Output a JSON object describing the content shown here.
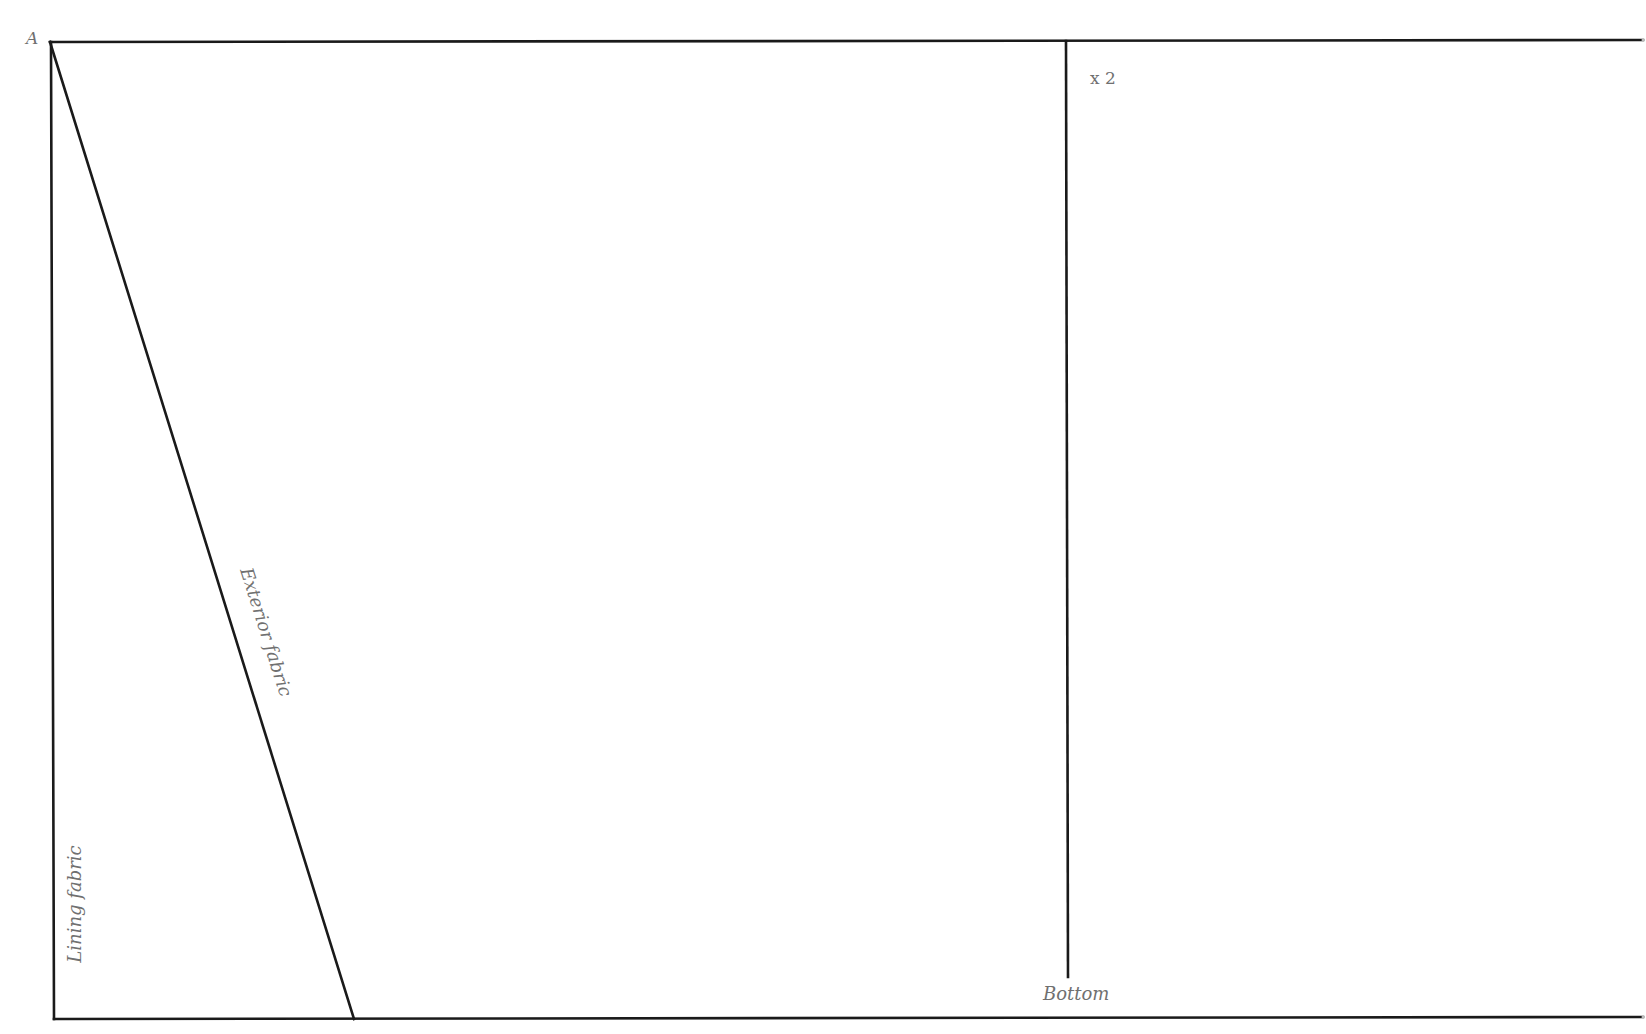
{
  "diagram": {
    "type": "sewing-pattern-piece",
    "stroke_color": "#1a1a1a",
    "label_color": "#707070",
    "background": "#ffffff",
    "points": {
      "A": [
        50,
        42
      ],
      "top_right": [
        1643,
        41
      ],
      "bottom_left": [
        54,
        1019
      ],
      "bottom_right": [
        1643,
        1018
      ],
      "diagonal_end": [
        354,
        1019
      ],
      "fold_top": [
        1066,
        41
      ],
      "fold_bottom": [
        1068,
        977
      ]
    },
    "lines": [
      {
        "name": "top-edge",
        "from": [
          50,
          42
        ],
        "to": [
          1643,
          40
        ]
      },
      {
        "name": "left-edge",
        "from": [
          51,
          42
        ],
        "to": [
          54,
          1019
        ]
      },
      {
        "name": "bottom-edge",
        "from": [
          54,
          1019
        ],
        "to": [
          1643,
          1017
        ]
      },
      {
        "name": "exterior-lining-divider",
        "from": [
          50,
          42
        ],
        "to": [
          354,
          1019
        ]
      },
      {
        "name": "fold-line",
        "from": [
          1066,
          41
        ],
        "to": [
          1068,
          977
        ]
      }
    ]
  },
  "labels": {
    "corner_a": "A",
    "quantity": "x 2",
    "bottom": "Bottom",
    "lining_fabric": "Lining fabric",
    "exterior_fabric": "Exterior fabric"
  }
}
